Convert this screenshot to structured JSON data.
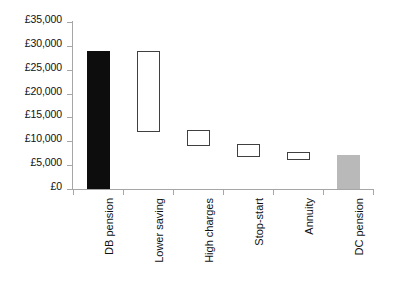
{
  "chart_data": {
    "type": "bar",
    "title": "",
    "subtitle": "",
    "xlabel": "",
    "ylabel": "",
    "grid": false,
    "legend": false,
    "orientation": "vertical",
    "bar_style": "floating-range",
    "currency": "£",
    "ylim": [
      0,
      35000
    ],
    "ytick_step": 5000,
    "ytick_labels": [
      "£35,000",
      "£30,000",
      "£25,000",
      "£20,000",
      "£15,000",
      "£10,000",
      "£5,000",
      "£0"
    ],
    "ytick_values": [
      35000,
      30000,
      25000,
      20000,
      15000,
      10000,
      5000,
      0
    ],
    "categories": [
      "DB pension",
      "Lower saving",
      "High charges",
      "Stop-start",
      "Annuity",
      "DC pension"
    ],
    "bars": [
      {
        "label": "DB pension",
        "low": 0,
        "high": 29000,
        "style": "filled-dark",
        "color": "#0d0d0d"
      },
      {
        "label": "Lower saving",
        "low": 12000,
        "high": 29000,
        "style": "outlined",
        "color": "#404040"
      },
      {
        "label": "High charges",
        "low": 9000,
        "high": 12300,
        "style": "outlined",
        "color": "#404040"
      },
      {
        "label": "Stop-start",
        "low": 6700,
        "high": 9400,
        "style": "outlined",
        "color": "#404040"
      },
      {
        "label": "Annuity",
        "low": 6100,
        "high": 7700,
        "style": "outlined",
        "color": "#404040"
      },
      {
        "label": "DC pension",
        "low": 0,
        "high": 7100,
        "style": "filled-gray",
        "color": "#b9b9b9"
      }
    ],
    "values": [
      29000,
      29000,
      12300,
      9400,
      7700,
      7100
    ],
    "axis_color": "#a6a6a6"
  }
}
